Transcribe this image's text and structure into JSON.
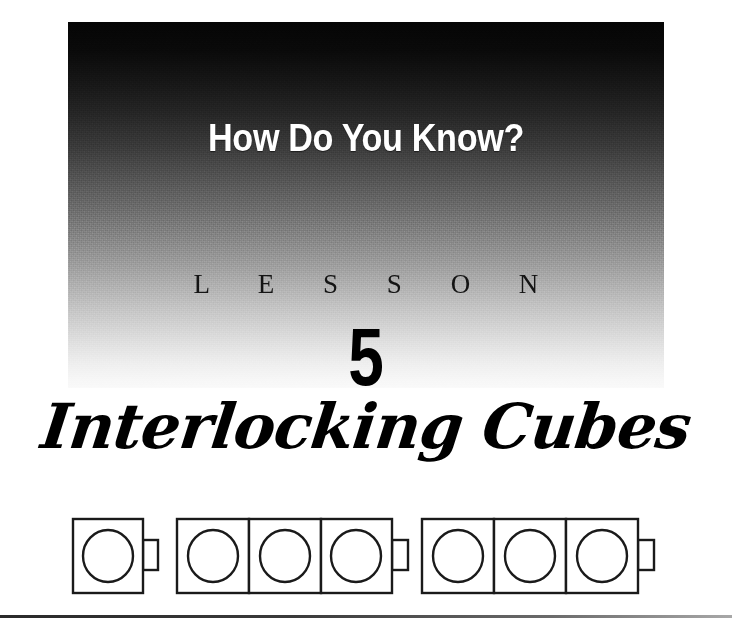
{
  "page": {
    "background_color": "#ffffff",
    "width": 732,
    "height": 626
  },
  "hero": {
    "title": "How Do You Know?",
    "kicker": "L E S S O N",
    "number": "5",
    "gradient_top_color": "#050505",
    "gradient_bottom_color": "#fafafa",
    "title_color": "#ffffff",
    "kicker_color": "#141414",
    "number_color": "#000000"
  },
  "lesson": {
    "name": "Interlocking Cubes",
    "name_color": "#000000"
  },
  "figure": {
    "name": "interlocking-cubes-diagram",
    "stroke_color": "#1a1a1a",
    "fill_color": "#ffffff",
    "groups": [
      {
        "label": "group-of-1",
        "cube_count": 1,
        "has_connector_tab": true
      },
      {
        "label": "group-of-3-left",
        "cube_count": 3,
        "has_connector_tab": true
      },
      {
        "label": "group-of-3-right",
        "cube_count": 3,
        "has_connector_tab": true
      }
    ],
    "total_cubes": 7
  },
  "footer": {
    "rule_color": "#2a2a2a"
  }
}
